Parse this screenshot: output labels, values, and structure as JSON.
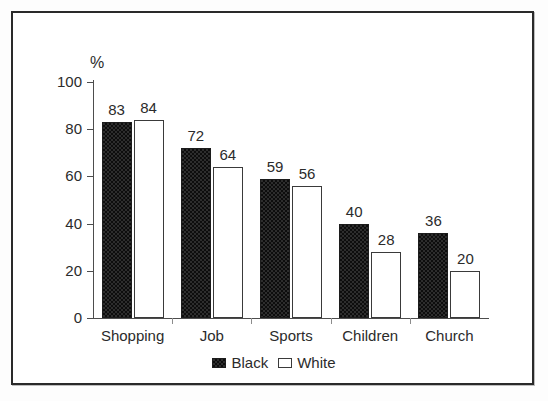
{
  "chart_data": {
    "type": "bar",
    "title": "",
    "subtitle": "",
    "xlabel": "",
    "ylabel": "%",
    "ylim": [
      0,
      100
    ],
    "yticks": [
      0,
      20,
      40,
      60,
      80,
      100
    ],
    "grid": false,
    "legend_position": "bottom-center",
    "categories": [
      "Shopping",
      "Job",
      "Sports",
      "Children",
      "Church"
    ],
    "series": [
      {
        "name": "Black",
        "fill": "checkered-dark",
        "color": "#2d2d2d",
        "values": [
          83,
          72,
          59,
          40,
          36
        ]
      },
      {
        "name": "White",
        "fill": "hollow",
        "color": "#ffffff",
        "values": [
          84,
          64,
          56,
          28,
          20
        ]
      }
    ]
  },
  "figure": {
    "frame_color": "#2a2a2a",
    "background": "#ffffff",
    "axis_color": "#4d4d4d",
    "text_color": "#2b2b2b"
  }
}
